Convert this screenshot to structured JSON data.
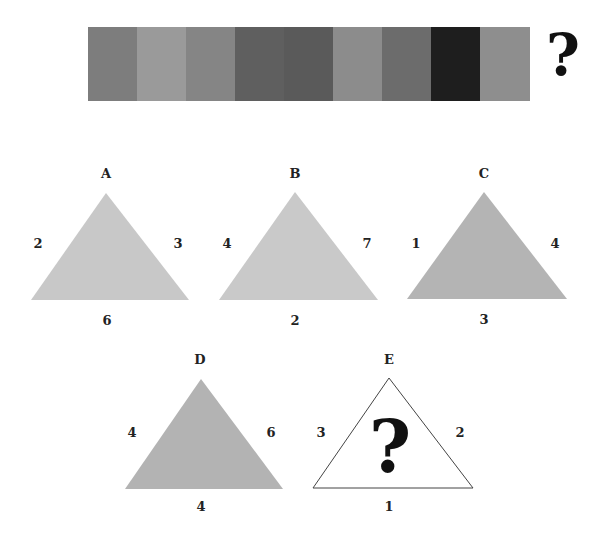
{
  "color_sequence": {
    "stripes": [
      {
        "index": 1,
        "color": "#7d7d7d"
      },
      {
        "index": 2,
        "color": "#9a9a9a"
      },
      {
        "index": 3,
        "color": "#858585"
      },
      {
        "index": 4,
        "color": "#5f5f5f"
      },
      {
        "index": 5,
        "color": "#5a5a5a"
      },
      {
        "index": 6,
        "color": "#8c8c8c"
      },
      {
        "index": 7,
        "color": "#6c6c6c"
      },
      {
        "index": 8,
        "color": "#1e1e1e"
      },
      {
        "index": 9,
        "color": "#8e8e8e"
      }
    ],
    "answer_mark": "?"
  },
  "triangles": [
    {
      "id": "A",
      "label": "A",
      "left": "2",
      "right": "3",
      "bottom": "6",
      "fill": "#c8c8c8",
      "filled": true
    },
    {
      "id": "B",
      "label": "B",
      "left": "4",
      "right": "7",
      "bottom": "2",
      "fill": "#c9c9c9",
      "filled": true
    },
    {
      "id": "C",
      "label": "C",
      "left": "1",
      "right": "4",
      "bottom": "3",
      "fill": "#b4b4b4",
      "filled": true
    },
    {
      "id": "D",
      "label": "D",
      "left": "4",
      "right": "6",
      "bottom": "4",
      "fill": "#b3b3b3",
      "filled": true
    },
    {
      "id": "E",
      "label": "E",
      "left": "3",
      "right": "2",
      "bottom": "1",
      "fill": "#ffffff",
      "filled": false,
      "center_mark": "?"
    }
  ]
}
